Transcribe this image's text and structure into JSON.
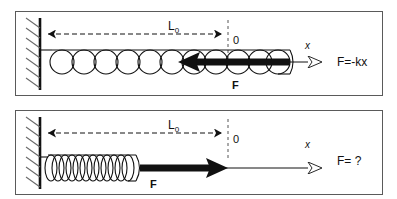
{
  "figure": {
    "background_color": "#ffffff",
    "stroke_color": "#111111",
    "panel_border_color": "#5a5a5a"
  },
  "panels": [
    {
      "id": "top",
      "state": "stretched",
      "wall": {
        "name": "fixed-wall",
        "hatching": "diagonal"
      },
      "measurement": {
        "label": "L",
        "subscript": "0",
        "style": "dashed double-headed arrow",
        "from_x": 42,
        "to_x": 228
      },
      "origin_label": "0",
      "origin_x": 228,
      "axis_label": "x",
      "spring": {
        "name": "spring-stretched",
        "coils": 11,
        "start_x": 42,
        "end_x": 290,
        "coil_style": "wide open loops"
      },
      "force_arrow": {
        "name": "force-arrow-left",
        "direction": "left",
        "fill": "solid black",
        "label": "F",
        "tip_x": 178,
        "tail_x": 290
      },
      "equation": "F=-kx"
    },
    {
      "id": "bottom",
      "state": "compressed",
      "wall": {
        "name": "fixed-wall",
        "hatching": "diagonal"
      },
      "measurement": {
        "label": "L",
        "subscript": "0",
        "style": "dashed double-headed arrow",
        "from_x": 42,
        "to_x": 228
      },
      "origin_label": "0",
      "origin_x": 228,
      "axis_label": "x",
      "spring": {
        "name": "spring-compressed",
        "coils": 14,
        "start_x": 42,
        "end_x": 140,
        "coil_style": "tight narrow loops"
      },
      "force_arrow": {
        "name": "force-arrow-right",
        "direction": "right",
        "fill": "solid black",
        "label": "F",
        "tail_x": 140,
        "tip_x": 222
      },
      "equation": "F= ?"
    }
  ],
  "labels": {
    "L0_base": "L",
    "L0_sub": "0",
    "origin": "0",
    "axis_x": "x",
    "force_F": "F",
    "equation_top": "F=-kx",
    "equation_bottom": "F= ?"
  }
}
